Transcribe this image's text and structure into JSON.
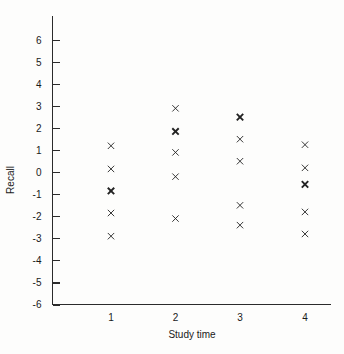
{
  "chart_data": {
    "type": "scatter",
    "title": "",
    "xlabel": "Study time",
    "ylabel": "Recall",
    "xlim": [
      0.35,
      4.6
    ],
    "ylim": [
      -6,
      6.6
    ],
    "grid": false,
    "legend": null,
    "x_ticks": [
      1,
      2,
      3,
      4
    ],
    "x_tick_labels": [
      "1",
      "2",
      "3",
      "4"
    ],
    "y_ticks": [
      6,
      5,
      4,
      3,
      2,
      1,
      0,
      -1,
      -2,
      -3,
      -4,
      -5,
      -6
    ],
    "y_tick_labels": [
      "6",
      "5",
      "4",
      "3",
      "2",
      "1",
      "0",
      "-1",
      "-2",
      "-3",
      "-4",
      "-5",
      "-6"
    ],
    "marker_symbol": "x",
    "marker_color": "#222222",
    "points": [
      {
        "x": 1,
        "y": 1.2,
        "overlap": 1
      },
      {
        "x": 1,
        "y": 0.15,
        "overlap": 1
      },
      {
        "x": 1,
        "y": -0.85,
        "overlap": 2
      },
      {
        "x": 1,
        "y": -1.85,
        "overlap": 1
      },
      {
        "x": 1,
        "y": -2.9,
        "overlap": 1
      },
      {
        "x": 2,
        "y": 2.9,
        "overlap": 1
      },
      {
        "x": 2,
        "y": 1.85,
        "overlap": 2
      },
      {
        "x": 2,
        "y": 0.9,
        "overlap": 1
      },
      {
        "x": 2,
        "y": -0.2,
        "overlap": 1
      },
      {
        "x": 2,
        "y": -2.1,
        "overlap": 1
      },
      {
        "x": 3,
        "y": 2.5,
        "overlap": 2
      },
      {
        "x": 3,
        "y": 1.5,
        "overlap": 1
      },
      {
        "x": 3,
        "y": 0.5,
        "overlap": 1
      },
      {
        "x": 3,
        "y": -1.5,
        "overlap": 1
      },
      {
        "x": 3,
        "y": -2.4,
        "overlap": 1
      },
      {
        "x": 4,
        "y": 1.25,
        "overlap": 1
      },
      {
        "x": 4,
        "y": 0.2,
        "overlap": 1
      },
      {
        "x": 4,
        "y": -0.55,
        "overlap": 2
      },
      {
        "x": 4,
        "y": -1.8,
        "overlap": 1
      },
      {
        "x": 4,
        "y": -2.8,
        "overlap": 1
      }
    ]
  }
}
